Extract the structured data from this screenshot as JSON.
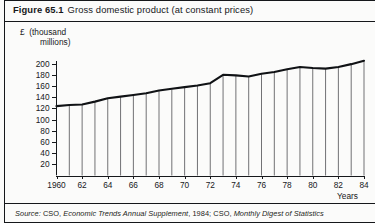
{
  "figure": {
    "number": "Figure 65.1",
    "caption": "Gross domestic product (at constant prices)"
  },
  "source": {
    "prefix": "Source:",
    "part1_plain": " CSO, ",
    "part1_italic": "Economic Trends Annual Supplement",
    "part2_plain": ", 1984; CSO, ",
    "part2_italic": "Monthly Digest of Statistics",
    "full": "Source: CSO, Economic Trends Annual Supplement, 1984; CSO, Monthly Digest of Statistics"
  },
  "chart_data": {
    "type": "bar",
    "title": "Gross domestic product (at constant prices)",
    "xlabel": "Years",
    "ylabel": "£ (thousand millions)",
    "ylabel_line1": "£  (thousand",
    "ylabel_line2": "millions)",
    "ylim": [
      0,
      210
    ],
    "xlim": [
      1960,
      1984
    ],
    "grid": false,
    "legend": null,
    "yticks": [
      20,
      40,
      60,
      80,
      100,
      120,
      140,
      160,
      180,
      200
    ],
    "ytick_labels": [
      "20",
      "40",
      "60",
      "80",
      "100",
      "120",
      "140",
      "160",
      "180",
      "200"
    ],
    "xticks": [
      1960,
      1962,
      1964,
      1966,
      1968,
      1970,
      1972,
      1974,
      1976,
      1978,
      1980,
      1982,
      1984
    ],
    "xtick_labels": [
      "1960",
      "62",
      "64",
      "66",
      "68",
      "70",
      "72",
      "74",
      "76",
      "78",
      "80",
      "82",
      "84"
    ],
    "categories": [
      1960,
      1961,
      1962,
      1963,
      1964,
      1965,
      1966,
      1967,
      1968,
      1969,
      1970,
      1971,
      1972,
      1973,
      1974,
      1975,
      1976,
      1977,
      1978,
      1979,
      1980,
      1981,
      1982,
      1983,
      1984
    ],
    "values": [
      124,
      126,
      127,
      132,
      138,
      141,
      144,
      147,
      152,
      155,
      158,
      161,
      165,
      180,
      179,
      177,
      182,
      185,
      190,
      194,
      192,
      191,
      194,
      199,
      205
    ]
  }
}
